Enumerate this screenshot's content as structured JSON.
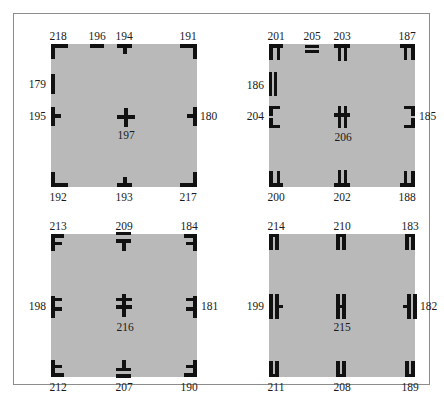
{
  "figure": {
    "background_color": "#ffffff",
    "frame_color": "#8d8d8d",
    "square_fill": "#b9b9b9",
    "mark_color": "#111111",
    "caption": ""
  },
  "panels": [
    {
      "name": "panel-top-left",
      "marks": [
        {
          "id": "218",
          "glyph": "corner-tl",
          "side": "top",
          "pos": "corner-top-left"
        },
        {
          "id": "196",
          "glyph": "bar-h",
          "side": "top",
          "pos": "top-third"
        },
        {
          "id": "194",
          "glyph": "tee-down",
          "side": "top",
          "pos": "top-center"
        },
        {
          "id": "191",
          "glyph": "corner-tr",
          "side": "top",
          "pos": "corner-top-right"
        },
        {
          "id": "179",
          "glyph": "bar-v",
          "side": "left",
          "pos": "left-upper"
        },
        {
          "id": "195",
          "glyph": "tee-right",
          "side": "left",
          "pos": "left-middle"
        },
        {
          "id": "197",
          "glyph": "cross",
          "side": "center",
          "pos": "center"
        },
        {
          "id": "180",
          "glyph": "tee-left",
          "side": "right",
          "pos": "right-middle"
        },
        {
          "id": "192",
          "glyph": "corner-bl",
          "side": "bottom",
          "pos": "corner-bottom-left"
        },
        {
          "id": "193",
          "glyph": "tee-up",
          "side": "bottom",
          "pos": "bottom-center"
        },
        {
          "id": "217",
          "glyph": "corner-br",
          "side": "bottom",
          "pos": "corner-bottom-right"
        }
      ]
    },
    {
      "name": "panel-top-right",
      "marks": [
        {
          "id": "201",
          "glyph": "corner-tl-dbl",
          "side": "top",
          "pos": "corner-top-left"
        },
        {
          "id": "205",
          "glyph": "bar-h-dbl",
          "side": "top",
          "pos": "top-third"
        },
        {
          "id": "203",
          "glyph": "tee-down-dbl",
          "side": "top",
          "pos": "top-center"
        },
        {
          "id": "187",
          "glyph": "corner-tr-dbl",
          "side": "top",
          "pos": "corner-top-right"
        },
        {
          "id": "186",
          "glyph": "bar-v-dbl",
          "side": "left",
          "pos": "left-upper"
        },
        {
          "id": "204",
          "glyph": "tee-right-dbl",
          "side": "left",
          "pos": "left-middle"
        },
        {
          "id": "206",
          "glyph": "cross-dbl",
          "side": "center",
          "pos": "center"
        },
        {
          "id": "185",
          "glyph": "tee-left-dbl",
          "side": "right",
          "pos": "right-middle"
        },
        {
          "id": "200",
          "glyph": "corner-bl-dbl",
          "side": "bottom",
          "pos": "corner-bottom-left"
        },
        {
          "id": "202",
          "glyph": "tee-up-dbl",
          "side": "bottom",
          "pos": "bottom-center"
        },
        {
          "id": "188",
          "glyph": "corner-br-dbl",
          "side": "bottom",
          "pos": "corner-bottom-right"
        }
      ]
    },
    {
      "name": "panel-bottom-left",
      "marks": [
        {
          "id": "213",
          "glyph": "corner-tl-sp",
          "side": "top",
          "pos": "corner-top-left"
        },
        {
          "id": "209",
          "glyph": "tee-down-sp",
          "side": "top",
          "pos": "top-center"
        },
        {
          "id": "184",
          "glyph": "corner-tr-sp",
          "side": "top",
          "pos": "corner-top-right"
        },
        {
          "id": "198",
          "glyph": "tee-right-sp",
          "side": "left",
          "pos": "left-middle"
        },
        {
          "id": "216",
          "glyph": "cross-sp",
          "side": "center",
          "pos": "center"
        },
        {
          "id": "181",
          "glyph": "tee-left-sp",
          "side": "right",
          "pos": "right-middle"
        },
        {
          "id": "212",
          "glyph": "corner-bl-sp",
          "side": "bottom",
          "pos": "corner-bottom-left"
        },
        {
          "id": "207",
          "glyph": "tee-up-sp",
          "side": "bottom",
          "pos": "bottom-center"
        },
        {
          "id": "190",
          "glyph": "corner-br-sp",
          "side": "bottom",
          "pos": "corner-bottom-right"
        }
      ]
    },
    {
      "name": "panel-bottom-right",
      "marks": [
        {
          "id": "214",
          "glyph": "pair-v",
          "side": "top",
          "pos": "corner-top-left"
        },
        {
          "id": "210",
          "glyph": "pair-v",
          "side": "top",
          "pos": "top-center"
        },
        {
          "id": "183",
          "glyph": "pair-v",
          "side": "top",
          "pos": "corner-top-right"
        },
        {
          "id": "199",
          "glyph": "pair-v-tick",
          "side": "left",
          "pos": "left-middle"
        },
        {
          "id": "215",
          "glyph": "pair-v-tick",
          "side": "center",
          "pos": "center"
        },
        {
          "id": "182",
          "glyph": "pair-v-tick-l",
          "side": "right",
          "pos": "right-middle"
        },
        {
          "id": "211",
          "glyph": "pair-v",
          "side": "bottom",
          "pos": "corner-bottom-left"
        },
        {
          "id": "208",
          "glyph": "pair-v",
          "side": "bottom",
          "pos": "bottom-center"
        },
        {
          "id": "189",
          "glyph": "pair-v",
          "side": "bottom",
          "pos": "corner-bottom-right"
        }
      ]
    }
  ]
}
